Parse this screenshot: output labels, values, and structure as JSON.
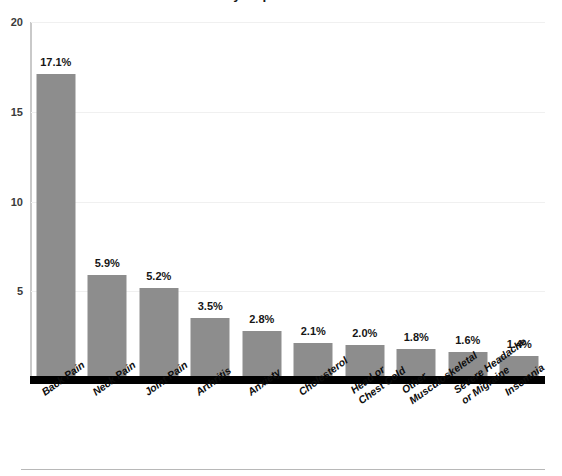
{
  "title": {
    "text": "Most Commonly Reported Health Conditions",
    "clipped": true
  },
  "chart_data": {
    "type": "bar",
    "title": "Most Commonly Reported Health Conditions",
    "xlabel": "",
    "ylabel": "",
    "ylim": [
      0,
      20
    ],
    "yticks": [
      20,
      15,
      10,
      5
    ],
    "grid": true,
    "legend": false,
    "bar_color": "#8d8d8d",
    "categories": [
      "Back Pain",
      "Neck Pain",
      "Joint Pain",
      "Arthritis",
      "Anxiety",
      "Cholesterol",
      "Head or Chest Cold",
      "Other Musculoskeletal",
      "Severe Headache or Migraine",
      "Insomnia"
    ],
    "category_lines": [
      [
        "Back Pain"
      ],
      [
        "Neck Pain"
      ],
      [
        "Joint Pain"
      ],
      [
        "Arthritis"
      ],
      [
        "Anxiety"
      ],
      [
        "Cholesterol"
      ],
      [
        "Head or",
        "Chest Cold"
      ],
      [
        "Other",
        "Musculoskeletal"
      ],
      [
        "Severe Headache",
        "or Migraine"
      ],
      [
        "Insomnia"
      ]
    ],
    "values": [
      17.1,
      5.9,
      5.2,
      3.5,
      2.8,
      2.1,
      2.0,
      1.8,
      1.6,
      1.4
    ],
    "value_labels": [
      "17.1%",
      "5.9%",
      "5.2%",
      "3.5%",
      "2.8%",
      "2.1%",
      "2.0%",
      "1.8%",
      "1.6%",
      "1.4%"
    ]
  }
}
